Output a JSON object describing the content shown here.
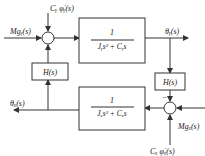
{
  "diagram": {
    "top_block": {
      "numerator": "1",
      "denominator": "Jᵧs² + Cᵧs"
    },
    "bottom_block": {
      "numerator": "1",
      "denominator": "Jₓs² + Cₓs"
    },
    "left_feedback": {
      "label": "H(s)"
    },
    "right_feedback": {
      "label": "H(s)"
    },
    "inputs": {
      "m_gy": "Mɡᵧ(s)",
      "cy_phi": "Cᵧ φ̇ᵧ(s)",
      "m_gx": "Mɡₓ(s)",
      "cx_phi": "Cₓ φ̇ₓ(s)"
    },
    "outputs": {
      "theta_y": "θᵧ(s)",
      "theta_x": "θₓ(s)"
    },
    "signs": {
      "right_junction_top": "−"
    },
    "colors": {
      "line": "#333333",
      "background": "#ffffff"
    }
  }
}
